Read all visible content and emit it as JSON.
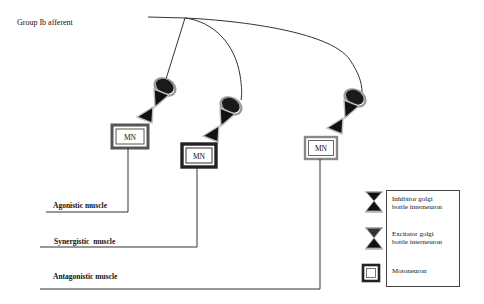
{
  "title_label": "Group Ib afferent",
  "motoneurons": [
    {
      "label": "MN",
      "target": "Agonistic muscle"
    },
    {
      "label": "MN",
      "target": "Synergistic muscle"
    },
    {
      "label": "MN",
      "target": "Antagonistic muscle"
    }
  ],
  "muscles": {
    "agonistic": "Agonistic muscle",
    "synergistic": "Synergistic  muscle",
    "antagonistic": "Antagonistic muscle"
  },
  "legend": {
    "inhibitor_line1": "Inhibitor golgi",
    "inhibitor_line2": "bottle interneuron",
    "excitator_line1": "Excitator golgi",
    "excitator_line2": "bottle interneuron",
    "motoneuron": "Motoneuron"
  },
  "icons": {
    "interneuron": "hourglass-icon",
    "motoneuron": "double-square-icon",
    "soma": "ellipse-soma-icon"
  },
  "colors": {
    "line": "#333333",
    "fill": "#111111",
    "background": "#ffffff"
  }
}
